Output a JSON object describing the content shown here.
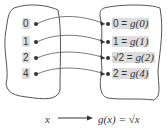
{
  "diagram": {
    "domain_set": {
      "items": [
        "0",
        "1",
        "2",
        "4"
      ]
    },
    "range_set": {
      "items": [
        {
          "value": "0",
          "expr": "g(0)"
        },
        {
          "value": "1",
          "expr": "g(1)"
        },
        {
          "value": "√2",
          "expr": "g(2)"
        },
        {
          "value": "2",
          "expr": "g(4)"
        }
      ]
    },
    "caption": {
      "input": "x",
      "output": "g(x) = √x"
    },
    "colors": {
      "stroke": "#555555",
      "label_bg": "#dddddd",
      "text": "#333333"
    }
  }
}
